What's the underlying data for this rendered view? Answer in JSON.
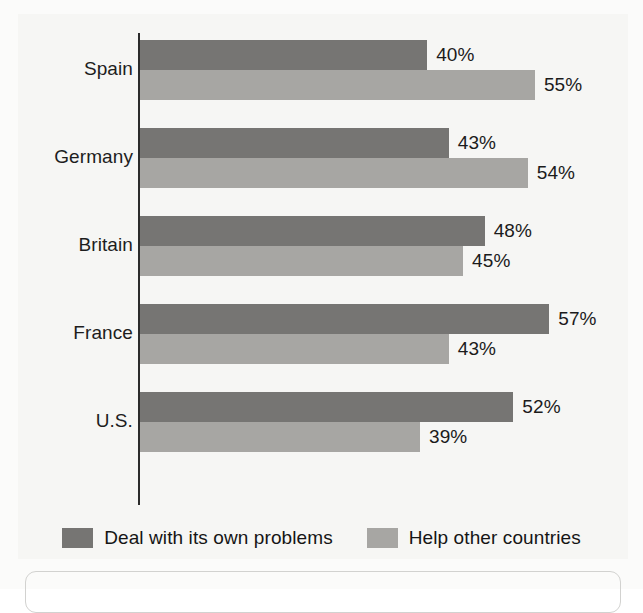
{
  "chart_data": {
    "type": "bar",
    "orientation": "horizontal",
    "title": "",
    "subtitle": "",
    "xlabel": "",
    "ylabel": "",
    "categories": [
      "Spain",
      "Germany",
      "Britain",
      "France",
      "U.S."
    ],
    "series": [
      {
        "name": "Deal with its own problems",
        "color": "#767573",
        "values": [
          40,
          43,
          48,
          57,
          52
        ],
        "value_labels": [
          "40%",
          "43%",
          "48%",
          "57%",
          "52%"
        ]
      },
      {
        "name": "Help other countries",
        "color": "#a7a6a3",
        "values": [
          55,
          54,
          45,
          43,
          39
        ],
        "value_labels": [
          "55%",
          "54%",
          "45%",
          "43%",
          "39%"
        ]
      }
    ],
    "xlim": [
      0,
      60
    ],
    "grid": false,
    "legend_position": "bottom",
    "value_suffix": "%"
  },
  "legend": {
    "items": [
      {
        "label": "Deal with its own problems",
        "color": "#767573"
      },
      {
        "label": "Help other countries",
        "color": "#a7a6a3"
      }
    ]
  },
  "colors": {
    "series_dark": "#767573",
    "series_light": "#a7a6a3",
    "axis": "#2b2b2b",
    "text": "#1b1b1b",
    "background": "#f6f6f4"
  }
}
